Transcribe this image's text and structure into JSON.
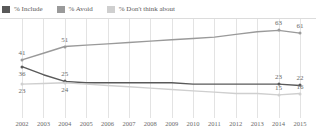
{
  "legend": {
    "position": "top-left",
    "items": [
      {
        "label": "% Include",
        "color": "#595959",
        "icon": "square-swatch"
      },
      {
        "label": "% Avoid",
        "color": "#9a9a9a",
        "icon": "square-swatch"
      },
      {
        "label": "% Don't think about",
        "color": "#cfcfcf",
        "icon": "square-swatch"
      }
    ]
  },
  "chart_data": {
    "type": "line",
    "title": "",
    "subtitle": "",
    "xlabel": "",
    "ylabel": "",
    "ylim": [
      0,
      70
    ],
    "xlim": [
      2002,
      2015
    ],
    "grid": "vertical",
    "legend_position": "top-left",
    "categories": [
      2002,
      2003,
      2004,
      2005,
      2006,
      2007,
      2008,
      2009,
      2010,
      2011,
      2012,
      2013,
      2014,
      2015
    ],
    "x_tick_labels": [
      "2002",
      "2003",
      "2004",
      "2005",
      "2006",
      "2007",
      "2008",
      "2009",
      "2010",
      "2011",
      "2012",
      "2013",
      "2014",
      "2015"
    ],
    "series": [
      {
        "name": "% Avoid",
        "color": "#9a9a9a",
        "values": [
          41,
          46,
          51,
          52,
          53,
          54,
          55,
          56,
          57,
          58,
          60,
          62,
          63,
          61
        ],
        "labeled_points": [
          {
            "x": 2002,
            "value": 41
          },
          {
            "x": 2004,
            "value": 51
          },
          {
            "x": 2014,
            "value": 63
          },
          {
            "x": 2015,
            "value": 61
          }
        ]
      },
      {
        "name": "% Include",
        "color": "#595959",
        "values": [
          36,
          30,
          25,
          24,
          24,
          24,
          24,
          24,
          23,
          23,
          23,
          23,
          23,
          22
        ],
        "labeled_points": [
          {
            "x": 2002,
            "value": 36
          },
          {
            "x": 2004,
            "value": 25
          },
          {
            "x": 2014,
            "value": 23
          },
          {
            "x": 2015,
            "value": 22
          }
        ]
      },
      {
        "name": "% Don't think about",
        "color": "#cfcfcf",
        "values": [
          23,
          23.5,
          24,
          23,
          22,
          21,
          20,
          19,
          18,
          17,
          16,
          16,
          15,
          16
        ],
        "labeled_points": [
          {
            "x": 2002,
            "value": 23
          },
          {
            "x": 2004,
            "value": 24
          },
          {
            "x": 2014,
            "value": 15
          },
          {
            "x": 2015,
            "value": 16
          }
        ]
      }
    ]
  }
}
